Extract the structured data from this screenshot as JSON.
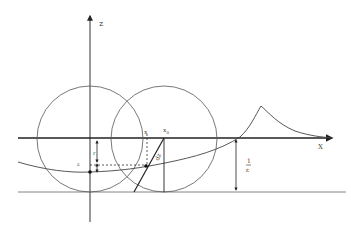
{
  "diagram": {
    "axes": {
      "vertical_label": "z",
      "horizontal_label": "X"
    },
    "labels": {
      "x": "x",
      "x0": "x",
      "x0_sub": "0",
      "r": "r",
      "z": "z",
      "dz": "dz",
      "epsilon_num": "1",
      "epsilon_den": "ε"
    },
    "colors": {
      "stroke": "#333333",
      "light_stroke": "#777777",
      "background": "#ffffff"
    }
  }
}
